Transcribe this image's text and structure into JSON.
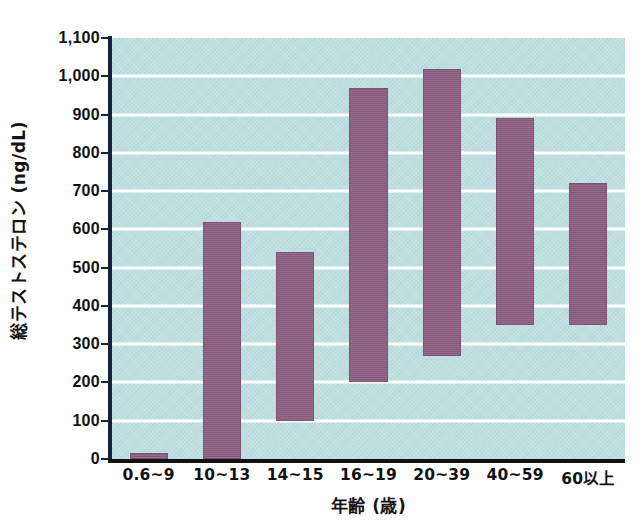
{
  "chart_data": {
    "type": "bar",
    "bar_style": "floating-range",
    "title": "",
    "xlabel": "年齢 (歳)",
    "ylabel": "総テストステロン (ng/dL)",
    "categories": [
      "0.6~9",
      "10~13",
      "14~15",
      "16~19",
      "20~39",
      "40~59",
      "60以上"
    ],
    "series": [
      {
        "name": "総テストステロン基準範囲",
        "low": [
          0,
          0,
          100,
          200,
          270,
          350,
          350
        ],
        "high": [
          15,
          620,
          540,
          970,
          1020,
          890,
          720
        ]
      }
    ],
    "ylim": [
      0,
      1100
    ],
    "ytick_step": 100,
    "ytick_labels": [
      "1,100",
      "1,000",
      "900",
      "800",
      "700",
      "600",
      "500",
      "400",
      "300",
      "200",
      "100",
      "0"
    ],
    "ytick_values": [
      1100,
      1000,
      900,
      800,
      700,
      600,
      500,
      400,
      300,
      200,
      100,
      0
    ],
    "grid": true,
    "grid_color": "#ffffff",
    "legend": null,
    "colors": {
      "bar": "#8d5f82",
      "bar_border": "#7d5274",
      "plot_background": "#bfdee0",
      "axis": "#16233f",
      "axis_x": "#111111",
      "text": "#111111",
      "page_background": "#ffffff"
    }
  }
}
